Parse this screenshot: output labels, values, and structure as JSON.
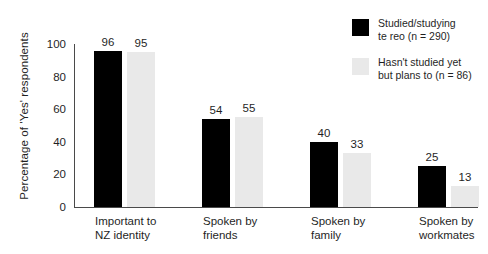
{
  "chart_data": {
    "type": "bar",
    "title": "",
    "xlabel": "",
    "ylabel": "Percentage of 'Yes' respondents",
    "ylim": [
      0,
      100
    ],
    "yticks": [
      0,
      20,
      40,
      60,
      80,
      100
    ],
    "grid": false,
    "legend_position": "top-right",
    "categories": [
      "Important to NZ identity",
      "Spoken by friends",
      "Spoken by family",
      "Spoken by workmates"
    ],
    "category_lines": [
      [
        "Important to",
        "NZ identity"
      ],
      [
        "Spoken by",
        "friends"
      ],
      [
        "Spoken by",
        "family"
      ],
      [
        "Spoken by",
        "workmates"
      ]
    ],
    "series": [
      {
        "name": "Studied/studying te reo (n = 290)",
        "legend_lines": [
          "Studied/studying",
          "te reo (n = 290)"
        ],
        "color": "#000000",
        "values": [
          96,
          54,
          40,
          25
        ]
      },
      {
        "name": "Hasn't studied yet but plans to (n = 86)",
        "legend_lines": [
          "Hasn't studied yet",
          "but plans to (n = 86)"
        ],
        "color": "#e9e9e9",
        "values": [
          95,
          55,
          33,
          13
        ]
      }
    ]
  }
}
